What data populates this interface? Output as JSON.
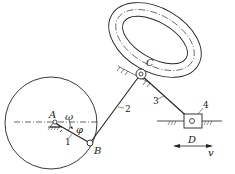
{
  "diagram": {
    "type": "mechanism-kinematic-sketch",
    "points": {
      "A": {
        "label": "A"
      },
      "B": {
        "label": "B"
      },
      "C": {
        "label": "C"
      },
      "D": {
        "label": "D"
      }
    },
    "links": {
      "link1": {
        "label": "1"
      },
      "link2": {
        "label": "2"
      },
      "link3": {
        "label": "3"
      },
      "link4": {
        "label": "4"
      }
    },
    "symbols": {
      "omega": "ω",
      "phi": "φ",
      "velocity": "v"
    },
    "colors": {
      "stroke": "#222222",
      "background": "#ffffff"
    }
  }
}
